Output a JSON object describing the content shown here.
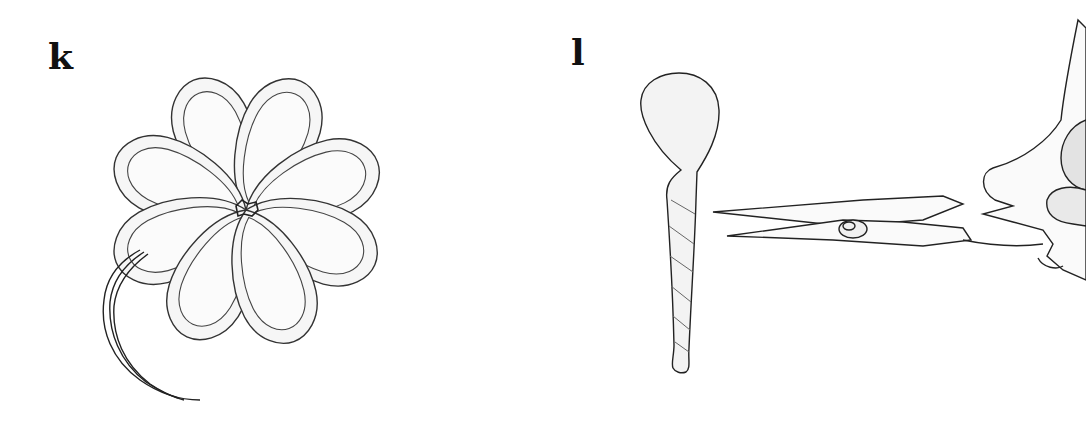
{
  "figure": {
    "panels": [
      {
        "label": "k",
        "description": "Eight-petal flower made of looped ribbon, tied at center with trailing wire stem"
      },
      {
        "label": "l",
        "description": "Twisted teardrop-shaped ribbon piece beside scissors held by a hand"
      }
    ],
    "colors": {
      "line": "#222222",
      "shade": "#e6e6e6",
      "background": "#ffffff"
    }
  }
}
